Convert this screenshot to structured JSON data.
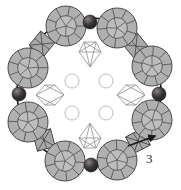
{
  "figure": {
    "label": "3",
    "label_position": {
      "x": 146,
      "y": 152
    },
    "background_color": "#ffffff",
    "canvas": {
      "width": 181,
      "height": 190
    },
    "ring": {
      "center": {
        "x": 89,
        "y": 92
      },
      "radius_x": 72,
      "radius_y": 74,
      "stroke_color": "#1a1a1a",
      "stroke_width": 1.6
    },
    "arrow": {
      "name": "ring-direction-arrow",
      "tip": {
        "x": 155,
        "y": 136
      },
      "tail": {
        "x": 128,
        "y": 146
      },
      "color": "#1a1a1a"
    },
    "clusters": {
      "count": 8,
      "fill_color": "#b0b0b0",
      "edge_color": "#4a4a4a",
      "radius": 20,
      "positions": [
        {
          "x": 66,
          "y": 26
        },
        {
          "x": 117,
          "y": 28
        },
        {
          "x": 152,
          "y": 66
        },
        {
          "x": 152,
          "y": 120
        },
        {
          "x": 117,
          "y": 160
        },
        {
          "x": 65,
          "y": 161
        },
        {
          "x": 28,
          "y": 122
        },
        {
          "x": 28,
          "y": 68
        }
      ]
    },
    "dark_spheres": {
      "count": 4,
      "fill_color": "#2e2b2b",
      "highlight_color": "#6b6565",
      "radius": 7,
      "positions": [
        {
          "x": 90,
          "y": 22
        },
        {
          "x": 159,
          "y": 94
        },
        {
          "x": 91,
          "y": 165
        },
        {
          "x": 19,
          "y": 94
        }
      ]
    },
    "ring_octahedra": {
      "count": 4,
      "fill_color": "#a8a8a8",
      "edge_color": "#3d3d3d",
      "size": 13,
      "positions": [
        {
          "x": 42,
          "y": 44
        },
        {
          "x": 136,
          "y": 46
        },
        {
          "x": 138,
          "y": 141
        },
        {
          "x": 44,
          "y": 140
        }
      ]
    },
    "inner_bipyramids": {
      "count": 2,
      "fill_color": "#ffffff",
      "edge_color": "#9a9a9a",
      "positions": [
        {
          "x": 90,
          "y": 54,
          "rotation": 0
        },
        {
          "x": 90,
          "y": 136,
          "rotation": 180
        }
      ]
    },
    "inner_octahedra": {
      "count": 2,
      "fill_color": "#ffffff",
      "edge_color": "#9a9a9a",
      "positions": [
        {
          "x": 50,
          "y": 95
        },
        {
          "x": 131,
          "y": 95
        }
      ]
    },
    "inner_circles": {
      "count": 4,
      "fill_color": "#ffffff",
      "edge_color": "#b5b5b5",
      "radius": 7,
      "positions": [
        {
          "x": 72,
          "y": 81
        },
        {
          "x": 106,
          "y": 81
        },
        {
          "x": 72,
          "y": 113
        },
        {
          "x": 106,
          "y": 113
        }
      ]
    }
  }
}
